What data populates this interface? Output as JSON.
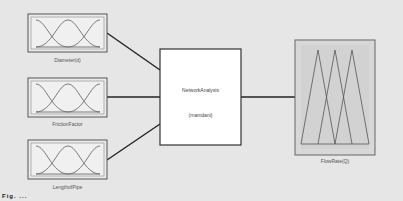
{
  "diagram": {
    "type": "fuzzy-inference-system",
    "inputs": [
      {
        "label": "Diameter(d)",
        "mf_shape": "gaussian",
        "mf_count": 3
      },
      {
        "label": "FrictionFactor",
        "mf_shape": "gaussian",
        "mf_count": 3
      },
      {
        "label": "LengthofPipe",
        "mf_shape": "gaussian",
        "mf_count": 3
      }
    ],
    "system": {
      "name": "NetworkAnalysis",
      "method": "(mamdani)"
    },
    "output": {
      "label": "FlowRate(Q)",
      "mf_shape": "triangular",
      "mf_count": 3
    },
    "caption": "Fig. ... "
  },
  "colors": {
    "background": "#e6e6e6",
    "box_border": "#555555",
    "curve": "#6b6b6b",
    "output_fill": "#d4d4d4",
    "connector": "#222222"
  }
}
